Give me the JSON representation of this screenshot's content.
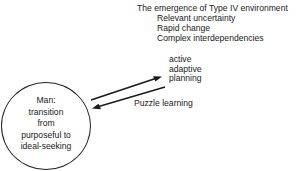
{
  "diagram": {
    "environment": {
      "title": "The emergence of Type IV environment",
      "items": [
        "Relevant uncertainty",
        "Rapid change",
        "Complex interdependencies"
      ]
    },
    "modes": {
      "items": [
        "active",
        "adaptive",
        "planning"
      ]
    },
    "puzzle_label": "Puzzle learning",
    "man_node": {
      "lines": [
        "Man:",
        "transition",
        "from",
        "purposeful to",
        "ideal-seeking"
      ]
    },
    "arrows": [
      {
        "from": "man",
        "to": "active adaptive planning",
        "direction": "up-right"
      },
      {
        "from": "puzzle learning",
        "to": "man",
        "direction": "down-left"
      }
    ],
    "colors": {
      "ink": "#1a1a1a",
      "background": "#ffffff"
    }
  }
}
